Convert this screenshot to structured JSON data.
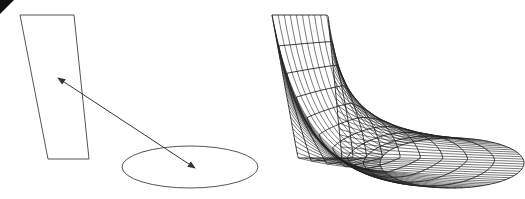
{
  "figure": {
    "width": 525,
    "height": 199,
    "background": "#ffffff",
    "corner_mark_color": "#111111"
  },
  "left_panel": {
    "label": "profiles-with-correspondence",
    "stroke": "#555555",
    "quad": [
      [
        20,
        15
      ],
      [
        74,
        15
      ],
      [
        89,
        159
      ],
      [
        48,
        159
      ]
    ],
    "ellipse": {
      "cx": 190,
      "cy": 167,
      "rx": 68,
      "ry": 21
    },
    "arrow": {
      "x1": 58,
      "y1": 78,
      "x2": 195,
      "y2": 168,
      "double_headed": true,
      "stroke": "#333333"
    }
  },
  "right_panel": {
    "label": "lofted-wireframe-surface",
    "stroke": "#222222",
    "quad": [
      [
        272,
        15
      ],
      [
        328,
        15
      ],
      [
        342,
        158
      ],
      [
        298,
        158
      ]
    ],
    "ellipse": {
      "cx": 452,
      "cy": 163,
      "rx": 72,
      "ry": 25
    },
    "rulings": 64,
    "sections": 9
  }
}
